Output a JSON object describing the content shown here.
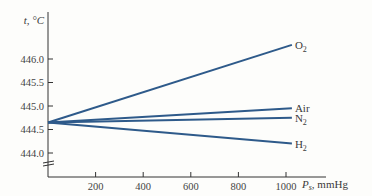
{
  "chart_data": {
    "type": "line",
    "title": "",
    "xlabel": "P_s, mmHg",
    "ylabel": "t, °C",
    "x_ticks": [
      200,
      400,
      600,
      800,
      1000
    ],
    "y_ticks": [
      "446.0",
      "445.5",
      "445.0",
      "444.5",
      "444.0"
    ],
    "xlim": [
      0,
      1100
    ],
    "ylim": [
      443.7,
      446.6
    ],
    "axis_break_y": true,
    "grid": false,
    "legend": "inline labels at line ends",
    "line_color": "#2e5a8a",
    "x": [
      0,
      1050
    ],
    "series": [
      {
        "name": "O2",
        "label_main": "O",
        "label_sub": "2",
        "values": [
          444.65,
          446.3
        ]
      },
      {
        "name": "Air",
        "label_main": "Air",
        "label_sub": "",
        "values": [
          444.65,
          444.95
        ]
      },
      {
        "name": "N2",
        "label_main": "N",
        "label_sub": "2",
        "values": [
          444.65,
          444.75
        ]
      },
      {
        "name": "H2",
        "label_main": "H",
        "label_sub": "2",
        "values": [
          444.65,
          444.2
        ]
      }
    ]
  },
  "axis": {
    "y_title_main": "t, °C",
    "x_title_main": "P",
    "x_title_sub": "s",
    "x_title_rest": ", mmHg"
  }
}
